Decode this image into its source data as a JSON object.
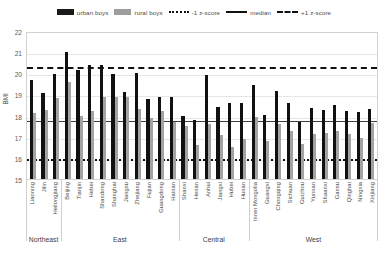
{
  "chart_data": {
    "type": "bar",
    "title": "",
    "xlabel": "",
    "ylabel": "BMI",
    "ylim": [
      15,
      22
    ],
    "yticks": [
      15,
      16,
      17,
      18,
      19,
      20,
      21,
      22
    ],
    "grid": true,
    "legend_position": "top-center",
    "legend": [
      {
        "label": "urban boys",
        "marker": "black-bar",
        "color": "#111111"
      },
      {
        "label": "rural boys",
        "marker": "gray-bar",
        "color": "#a3a3a3"
      },
      {
        "label": "-1 z-score",
        "marker": "dotted-line",
        "color": "#111111"
      },
      {
        "label": "median",
        "marker": "solid-line",
        "color": "#3f3f3f"
      },
      {
        "label": "+1 z-score",
        "marker": "dashed-line",
        "color": "#111111"
      }
    ],
    "reference_lines": [
      {
        "name": "+1 z-score",
        "value": 20.4,
        "style": "dashed"
      },
      {
        "name": "median",
        "value": 17.85,
        "style": "solid"
      },
      {
        "name": "-1 z-score",
        "value": 16.05,
        "style": "dotted"
      }
    ],
    "categories": [
      "Liaoning",
      "Jilin",
      "Heilongjiang",
      "Beijing",
      "Tianjin",
      "Hebei",
      "Shandong",
      "Shanghai",
      "Jiangsu",
      "Zhejiang",
      "Fujian",
      "Guangdong",
      "Hainan",
      "Shanxi",
      "Henan",
      "Anhui",
      "Jiangxi",
      "Hubei",
      "Hunan",
      "Inner Mongolia",
      "Guangxi",
      "Chongqing",
      "Sichuan",
      "Guizhou",
      "Yunnan",
      "Shaanxi",
      "Gansu",
      "Qinghai",
      "Ningxia",
      "Xinjiang"
    ],
    "series": [
      {
        "name": "urban boys",
        "color": "#111111",
        "values": [
          19.7,
          19.05,
          19.95,
          21.0,
          20.15,
          20.4,
          20.4,
          19.95,
          19.1,
          20.0,
          18.8,
          18.9,
          18.9,
          18.0,
          17.8,
          19.9,
          18.4,
          18.6,
          18.6,
          19.45,
          18.05,
          19.15,
          18.6,
          17.7,
          18.35,
          18.25,
          18.5,
          18.2,
          18.15,
          18.3
        ]
      },
      {
        "name": "rural boys",
        "color": "#a3a3a3",
        "values": [
          18.1,
          18.25,
          18.85,
          19.6,
          18.0,
          18.2,
          18.9,
          18.9,
          18.9,
          18.3,
          17.9,
          18.2,
          17.7,
          17.5,
          16.6,
          17.6,
          17.1,
          16.5,
          16.9,
          17.95,
          16.8,
          17.6,
          17.25,
          16.65,
          17.15,
          17.2,
          17.25,
          17.15,
          16.95,
          17.65
        ]
      }
    ],
    "region_groups": [
      {
        "label": "Northeast",
        "span": 3
      },
      {
        "label": "East",
        "span": 10
      },
      {
        "label": "Central",
        "span": 6
      },
      {
        "label": "West",
        "span": 11
      }
    ]
  }
}
